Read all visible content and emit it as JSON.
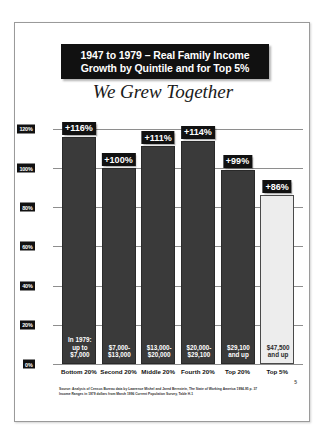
{
  "slide": {
    "title_line1": "1947 to 1979 – Real Family Income",
    "title_line2": "Growth by Quintile and for Top 5%",
    "subtitle": "We Grew Together",
    "page_mark": "5",
    "source_line1": "Source: Analysis of Census Bureau data by Lawrence Mishel and Jared Bernstein, The State of Working America 1994-95 p. 37",
    "source_line2": "Income Ranges in 1979 dollars from March 1996 Current Population Survey, Table H-1"
  },
  "chart_data": {
    "type": "bar",
    "title": "1947 to 1979 – Real Family Income Growth by Quintile and for Top 5%",
    "subtitle": "We Grew Together",
    "xlabel": "",
    "ylabel": "",
    "ylim": [
      0,
      125
    ],
    "grid": true,
    "legend": "none",
    "categories": [
      "Bottom 20%",
      "Second 20%",
      "Middle 20%",
      "Fourth 20%",
      "Top 20%",
      "Top 5%"
    ],
    "values": [
      116,
      100,
      111,
      114,
      99,
      86
    ],
    "value_labels": [
      "+116%",
      "+100%",
      "+111%",
      "+114%",
      "+99%",
      "+86%"
    ],
    "bar_annotations": [
      [
        "In 1979:",
        "up to",
        "$7,000"
      ],
      [
        "$7,000-",
        "$13,000"
      ],
      [
        "$13,000-",
        "$20,000"
      ],
      [
        "$20,000-",
        "$29,100"
      ],
      [
        "$29,100",
        "and up"
      ],
      [
        "$47,500",
        "and up"
      ]
    ],
    "bar_styles": [
      "dark",
      "dark",
      "dark",
      "dark",
      "dark",
      "light"
    ],
    "yticks": [
      0,
      20,
      40,
      60,
      80,
      100,
      120
    ],
    "ytick_labels": [
      "0%",
      "20%",
      "40%",
      "60%",
      "80%",
      "100%",
      "120%"
    ],
    "colors": {
      "bar_dark": "#3a3a3a",
      "bar_light": "#ededed",
      "label_bg": "#111111",
      "label_text": "#ffffff",
      "gridline": "#8e8e8e"
    }
  }
}
